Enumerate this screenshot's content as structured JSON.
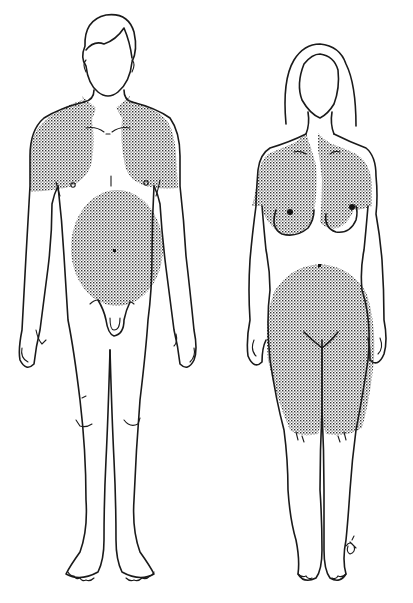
{
  "figure": {
    "panels": [
      {
        "label": "male-figure",
        "shaded_regions": [
          "shoulders-upper-chest-upper-arms",
          "abdomen-around-navel"
        ]
      },
      {
        "label": "female-figure",
        "shaded_regions": [
          "shoulders-chest-breasts-upper-arms",
          "hips-buttocks-thighs-lower-abdomen"
        ]
      }
    ],
    "colors": {
      "line": "#1a1a1a",
      "stipple": "#333333",
      "background": "#ffffff"
    },
    "signature_mark": "artist-monogram"
  },
  "cropped_text": {
    "top": "",
    "bottom": ""
  }
}
